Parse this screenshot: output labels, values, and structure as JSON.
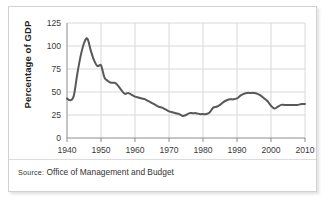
{
  "figure": {
    "source_prefix": "Source:",
    "source_text": "Office of Management and Budget"
  },
  "chart_data": {
    "type": "line",
    "title": "",
    "xlabel": "",
    "ylabel": "Percentage of GDP",
    "xlim": [
      1940,
      2010
    ],
    "ylim": [
      0,
      125
    ],
    "grid": true,
    "legend_position": "none",
    "line_color": "#58585a",
    "xticks": [
      1940,
      1950,
      1960,
      1970,
      1980,
      1990,
      2000,
      2010
    ],
    "yticks": [
      0,
      25,
      50,
      75,
      100,
      125
    ],
    "xtick_labels": [
      "1940",
      "1950",
      "1960",
      "1970",
      "1980",
      "1990",
      "2000",
      "2010"
    ],
    "ytick_labels": [
      "0",
      "25",
      "50",
      "75",
      "100",
      "125"
    ],
    "x": [
      1940,
      1941,
      1942,
      1943,
      1944,
      1945,
      1946,
      1947,
      1948,
      1949,
      1950,
      1951,
      1952,
      1953,
      1954,
      1955,
      1956,
      1957,
      1958,
      1959,
      1960,
      1961,
      1962,
      1963,
      1964,
      1965,
      1966,
      1967,
      1968,
      1969,
      1970,
      1971,
      1972,
      1973,
      1974,
      1975,
      1976,
      1977,
      1978,
      1979,
      1980,
      1981,
      1982,
      1983,
      1984,
      1985,
      1986,
      1987,
      1988,
      1989,
      1990,
      1991,
      1992,
      1993,
      1994,
      1995,
      1996,
      1997,
      1998,
      1999,
      2000,
      2001,
      2002,
      2003,
      2004,
      2005,
      2006,
      2007,
      2008,
      2009,
      2010
    ],
    "values": [
      43,
      41,
      46,
      69,
      89,
      103,
      108,
      95,
      84,
      78,
      79,
      66,
      62,
      60,
      60,
      57,
      52,
      48,
      49,
      47,
      45,
      44,
      43,
      42,
      40,
      38,
      36,
      34,
      33,
      31,
      29,
      28,
      27,
      26,
      24,
      25,
      27,
      27,
      27,
      26,
      26,
      26,
      28,
      33,
      34,
      36,
      39,
      41,
      42,
      42,
      43,
      46,
      48,
      49,
      49,
      49,
      48,
      46,
      43,
      40,
      35,
      32,
      34,
      36,
      36,
      36,
      36,
      36,
      36,
      37,
      37
    ],
    "series_name": "Federal debt"
  }
}
